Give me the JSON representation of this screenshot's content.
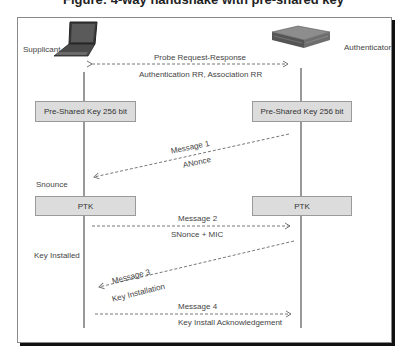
{
  "title": "Figure: 4-way handshake with pre-shared key",
  "entities": {
    "supplicant": {
      "label": "Supplicant",
      "icon": "laptop-icon"
    },
    "authenticator": {
      "label": "Authenticator",
      "icon": "access-point-icon"
    }
  },
  "probe": {
    "top_label": "Probe Request-Response",
    "bottom_label": "Authentication RR, Association RR"
  },
  "psk": {
    "supplicant_label": "Pre-Shared Key 256 bit",
    "authenticator_label": "Pre-Shared Key 256 bit"
  },
  "message1": {
    "title": "Message 1",
    "payload": "ANonce"
  },
  "snounce_label": "Snounce",
  "ptk": {
    "supplicant_label": "PTK",
    "authenticator_label": "PTK"
  },
  "message2": {
    "title": "Message 2",
    "payload": "SNonce + MIC"
  },
  "key_installed_label": "Key Installed",
  "message3": {
    "title": "Message 3",
    "payload": "Key Installation"
  },
  "message4": {
    "title": "Message 4",
    "payload": "Key Install Acknowledgement"
  },
  "colors": {
    "box_fill": "#dcdcdc",
    "line": "#333333",
    "dashed": "#777777",
    "shadow": "#111111"
  }
}
